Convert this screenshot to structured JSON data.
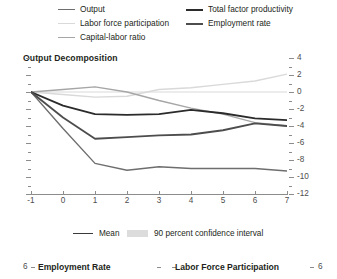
{
  "top_legend": {
    "left_column": [
      {
        "label": "Output",
        "color": "#6e6e6e"
      },
      {
        "label": "Labor force participation",
        "color": "#d9d9d9"
      },
      {
        "label": "Capital-labor ratio",
        "color": "#a6a6a6"
      }
    ],
    "right_column": [
      {
        "label": "Total factor productivity",
        "color": "#2b2b2b"
      },
      {
        "label": "Employment rate",
        "color": "#4d4d4d"
      }
    ]
  },
  "bottom_legend": {
    "mean_label": "Mean",
    "mean_color": "#3a3a3a",
    "ci_label": "90 percent confidence interval",
    "ci_color": "#dcdcdc"
  },
  "bottom_panels": {
    "left_title": "Employment Rate",
    "right_title": "Labor Force Participation",
    "left_tick_label": "6",
    "right_tick_label": "6"
  },
  "chart_data": {
    "type": "line",
    "title": "Output Decomposition",
    "xlabel": "",
    "ylabel": "",
    "xlim": [
      -1,
      7
    ],
    "ylim": [
      -12,
      4
    ],
    "xticks": [
      -1,
      0,
      1,
      2,
      3,
      4,
      5,
      6,
      7
    ],
    "xtick_labels": [
      "-1",
      "0",
      "1",
      "2",
      "3",
      "4",
      "5",
      "6",
      "7"
    ],
    "yticks": [
      4,
      2,
      0,
      -2,
      -4,
      -6,
      -8,
      -10,
      -12
    ],
    "ytick_labels": [
      "4",
      "2",
      "0",
      "-2",
      "-4",
      "-6",
      "-8",
      "-10",
      "-12"
    ],
    "y_minor_ticks": [
      3,
      1,
      -1,
      -3,
      -5,
      -7,
      -9,
      -11
    ],
    "yaxis_position": "right",
    "grid": false,
    "legend_position": "top",
    "x": [
      -1,
      0,
      1,
      2,
      3,
      4,
      5,
      6,
      7
    ],
    "series": [
      {
        "name": "Output",
        "color": "#6e6e6e",
        "width": 1.4,
        "values": [
          0,
          -4.3,
          -8.4,
          -9.2,
          -8.8,
          -9.0,
          -9.0,
          -9.0,
          -9.3
        ]
      },
      {
        "name": "Labor force participation",
        "color": "#d9d9d9",
        "width": 1.4,
        "values": [
          0,
          -0.3,
          -0.6,
          -0.5,
          0.3,
          0.5,
          0.9,
          1.3,
          2.1
        ]
      },
      {
        "name": "Capital-labor ratio",
        "color": "#a6a6a6",
        "width": 1.4,
        "values": [
          0,
          0.3,
          0.6,
          0.0,
          -1.0,
          -1.9,
          -2.6,
          -3.6,
          -4.0
        ]
      },
      {
        "name": "Total factor productivity",
        "color": "#2b2b2b",
        "width": 1.8,
        "values": [
          0,
          -1.6,
          -2.6,
          -2.7,
          -2.6,
          -2.1,
          -2.5,
          -3.1,
          -3.3
        ]
      },
      {
        "name": "Employment rate",
        "color": "#4d4d4d",
        "width": 1.8,
        "values": [
          0,
          -3.0,
          -5.5,
          -5.3,
          -5.1,
          -5.0,
          -4.5,
          -3.7,
          -4.0
        ]
      }
    ]
  }
}
